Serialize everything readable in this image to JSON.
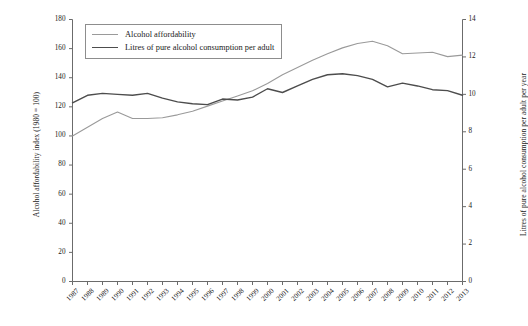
{
  "chart_data": {
    "type": "line",
    "title": "",
    "xlabel": "",
    "grid": false,
    "legend_position": "top-left",
    "x": [
      1987,
      1988,
      1989,
      1990,
      1991,
      1992,
      1993,
      1994,
      1995,
      1996,
      1997,
      1998,
      1999,
      2000,
      2001,
      2002,
      2003,
      2004,
      2005,
      2006,
      2007,
      2008,
      2009,
      2010,
      2011,
      2012,
      2013
    ],
    "categories": [
      "1987",
      "1988",
      "1989",
      "1990",
      "1991",
      "1992",
      "1993",
      "1994",
      "1995",
      "1996",
      "1997",
      "1998",
      "1999",
      "2000",
      "2001",
      "2002",
      "2003",
      "2004",
      "2005",
      "2006",
      "2007",
      "2008",
      "2009",
      "2010",
      "2011",
      "2012",
      "2013"
    ],
    "axes": {
      "left": {
        "label": "Alcohol affordability index (1980 = 100)",
        "min": 0,
        "max": 180,
        "step": 20,
        "ticks": [
          "0",
          "20",
          "40",
          "60",
          "80",
          "100",
          "120",
          "140",
          "160",
          "180"
        ]
      },
      "right": {
        "label": "Litres of pure alcohol consumption per adult per year",
        "min": 0,
        "max": 14,
        "step": 2,
        "ticks": [
          "0",
          "2",
          "4",
          "6",
          "8",
          "10",
          "12",
          "14"
        ]
      }
    },
    "series": [
      {
        "name": "Alcohol affordability",
        "axis": "left",
        "color": "#9a9a9a",
        "width": 1.1,
        "values": [
          100.0,
          106.0,
          112.0,
          116.5,
          112.0,
          112.0,
          112.5,
          114.5,
          117.0,
          120.5,
          124.0,
          127.5,
          131.0,
          136.0,
          142.0,
          147.0,
          152.0,
          156.5,
          160.5,
          163.5,
          165.0,
          162.0,
          156.5,
          157.0,
          157.5,
          154.5,
          155.5
        ]
      },
      {
        "name": "Litres of pure alcohol consumption per adult",
        "axis": "right",
        "color": "#4d4d4d",
        "width": 1.4,
        "values": [
          9.55,
          9.95,
          10.05,
          10.0,
          9.95,
          10.05,
          9.8,
          9.6,
          9.5,
          9.45,
          9.75,
          9.7,
          9.85,
          10.3,
          10.1,
          10.45,
          10.8,
          11.05,
          11.1,
          11.0,
          10.8,
          10.4,
          10.6,
          10.45,
          10.25,
          10.2,
          9.95
        ]
      }
    ]
  },
  "legend": {
    "items": [
      {
        "label": "Alcohol affordability",
        "color": "#9a9a9a"
      },
      {
        "label": "Litres of pure alcohol consumption per adult",
        "color": "#4d4d4d"
      }
    ]
  }
}
